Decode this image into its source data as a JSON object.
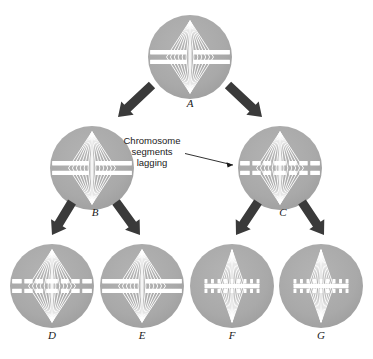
{
  "figure": {
    "type": "biology-diagram",
    "background_color": "#ffffff",
    "cell_fill_color": "#a8a8a8",
    "cell_fill_color_light": "#b0b0b0",
    "spindle_color": "#ffffff",
    "chromosome_color": "#ffffff",
    "arrow_color": "#3a3a3a",
    "text_color": "#1a1a1a"
  },
  "annotation": {
    "line1": "Chromosome",
    "line2": "segments",
    "line3": "lagging",
    "points_to": "C"
  },
  "cells": [
    {
      "id": "A",
      "label": "A",
      "cx": 190,
      "cy": 57,
      "r": 42,
      "generation": 1,
      "band_style": "solid-plate",
      "spindle": "wide",
      "fragments": false
    },
    {
      "id": "B",
      "label": "B",
      "cx": 92,
      "cy": 168,
      "r": 42,
      "generation": 2,
      "band_style": "solid-plate",
      "spindle": "wide",
      "fragments": false
    },
    {
      "id": "C",
      "label": "C",
      "cx": 280,
      "cy": 168,
      "r": 42,
      "generation": 2,
      "band_style": "fragmented-plate",
      "spindle": "wide",
      "fragments": true
    },
    {
      "id": "D",
      "label": "D",
      "cx": 52,
      "cy": 286,
      "r": 42,
      "generation": 3,
      "band_style": "fragmented-plate",
      "spindle": "wide",
      "fragments": true
    },
    {
      "id": "E",
      "label": "E",
      "cx": 142,
      "cy": 286,
      "r": 42,
      "generation": 3,
      "band_style": "solid-plate",
      "spindle": "wide",
      "fragments": false
    },
    {
      "id": "F",
      "label": "F",
      "cx": 232,
      "cy": 286,
      "r": 42,
      "generation": 3,
      "band_style": "dotted-plate",
      "spindle": "narrow",
      "fragments": true
    },
    {
      "id": "G",
      "label": "G",
      "cx": 321,
      "cy": 286,
      "r": 42,
      "generation": 3,
      "band_style": "dotted-plate",
      "spindle": "narrow",
      "fragments": true
    }
  ],
  "arrows": [
    {
      "id": "A-to-B",
      "from": "A",
      "to": "B",
      "x1": 152,
      "y1": 85,
      "x2": 118,
      "y2": 117
    },
    {
      "id": "A-to-C",
      "from": "A",
      "to": "C",
      "x1": 228,
      "y1": 85,
      "x2": 262,
      "y2": 117
    },
    {
      "id": "B-to-D",
      "from": "B",
      "to": "D",
      "x1": 72,
      "y1": 202,
      "x2": 52,
      "y2": 235
    },
    {
      "id": "B-to-E",
      "from": "B",
      "to": "E",
      "x1": 116,
      "y1": 202,
      "x2": 140,
      "y2": 235
    },
    {
      "id": "C-to-F",
      "from": "C",
      "to": "F",
      "x1": 258,
      "y1": 202,
      "x2": 236,
      "y2": 235
    },
    {
      "id": "C-to-G",
      "from": "C",
      "to": "G",
      "x1": 302,
      "y1": 202,
      "x2": 324,
      "y2": 235
    }
  ],
  "labels": {
    "A": {
      "text": "A",
      "x": 190,
      "y": 104
    },
    "B": {
      "text": "B",
      "x": 95,
      "y": 213
    },
    "C": {
      "text": "C",
      "x": 283,
      "y": 213
    },
    "D": {
      "text": "D",
      "x": 52,
      "y": 336
    },
    "E": {
      "text": "E",
      "x": 142,
      "y": 336
    },
    "F": {
      "text": "F",
      "x": 232,
      "y": 336
    },
    "G": {
      "text": "G",
      "x": 321,
      "y": 336
    }
  }
}
